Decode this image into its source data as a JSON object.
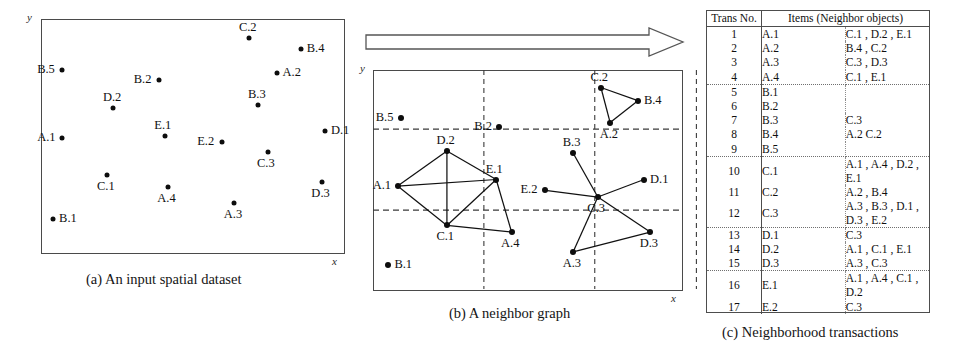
{
  "figure": {
    "panels": [
      {
        "id": "a",
        "caption": "(a) An input spatial dataset",
        "y_axis_label": "y",
        "x_axis_label": "x"
      },
      {
        "id": "b",
        "caption": "(b) A neighbor graph",
        "y_axis_label": "y",
        "x_axis_label": "x"
      },
      {
        "id": "c",
        "caption": "(c) Neighborhood transactions"
      }
    ],
    "arrow": "right-block-arrow"
  },
  "chart_data": {
    "type": "scatter",
    "xlabel": "x",
    "ylabel": "y",
    "xlim": [
      0,
      100
    ],
    "ylim": [
      0,
      100
    ],
    "grid": false,
    "panel_a": {
      "type": "scatter",
      "title": "(a) An input spatial dataset",
      "xlabel": "x",
      "ylabel": "y",
      "points": [
        {
          "name": "B.5",
          "x": 7,
          "y": 78,
          "label_pos": "left"
        },
        {
          "name": "C.2",
          "x": 69,
          "y": 92,
          "label_pos": "above"
        },
        {
          "name": "B.4",
          "x": 86,
          "y": 87,
          "label_pos": "right"
        },
        {
          "name": "A.2",
          "x": 78,
          "y": 77,
          "label_pos": "right"
        },
        {
          "name": "B.2",
          "x": 39,
          "y": 74,
          "label_pos": "left"
        },
        {
          "name": "B.3",
          "x": 72,
          "y": 63,
          "label_pos": "above"
        },
        {
          "name": "D.2",
          "x": 24,
          "y": 62,
          "label_pos": "above"
        },
        {
          "name": "D.1",
          "x": 94,
          "y": 52,
          "label_pos": "right"
        },
        {
          "name": "E.1",
          "x": 41,
          "y": 50,
          "label_pos": "above"
        },
        {
          "name": "A.1",
          "x": 7,
          "y": 49,
          "label_pos": "left"
        },
        {
          "name": "E.2",
          "x": 60,
          "y": 47,
          "label_pos": "left"
        },
        {
          "name": "C.3",
          "x": 75,
          "y": 43,
          "label_pos": "below"
        },
        {
          "name": "C.1",
          "x": 22,
          "y": 33,
          "label_pos": "below"
        },
        {
          "name": "D.3",
          "x": 93,
          "y": 30,
          "label_pos": "below"
        },
        {
          "name": "A.4",
          "x": 42,
          "y": 28,
          "label_pos": "below"
        },
        {
          "name": "A.3",
          "x": 64,
          "y": 21,
          "label_pos": "below"
        },
        {
          "name": "B.1",
          "x": 4,
          "y": 14,
          "label_pos": "right"
        }
      ]
    },
    "panel_b": {
      "type": "scatter",
      "title": "(b) A neighbor graph",
      "xlabel": "x",
      "ylabel": "y",
      "grid": true,
      "gridlines": {
        "vertical": [
          36,
          72,
          105
        ],
        "horizontal": [
          36,
          73
        ]
      },
      "points": [
        {
          "name": "B.5",
          "x": 9,
          "y": 78,
          "label_pos": "left"
        },
        {
          "name": "C.2",
          "x": 74,
          "y": 92,
          "label_pos": "above"
        },
        {
          "name": "B.4",
          "x": 86,
          "y": 86,
          "label_pos": "right"
        },
        {
          "name": "A.2",
          "x": 77,
          "y": 76,
          "label_pos": "below"
        },
        {
          "name": "B.2",
          "x": 41,
          "y": 74,
          "label_pos": "left"
        },
        {
          "name": "B.3",
          "x": 65,
          "y": 62,
          "label_pos": "above"
        },
        {
          "name": "D.2",
          "x": 24,
          "y": 63,
          "label_pos": "above"
        },
        {
          "name": "D.1",
          "x": 88,
          "y": 50,
          "label_pos": "right"
        },
        {
          "name": "E.1",
          "x": 40,
          "y": 50,
          "label_pos": "above"
        },
        {
          "name": "A.1",
          "x": 8,
          "y": 47,
          "label_pos": "left"
        },
        {
          "name": "E.2",
          "x": 56,
          "y": 45,
          "label_pos": "left"
        },
        {
          "name": "C.3",
          "x": 73,
          "y": 42,
          "label_pos": "below"
        },
        {
          "name": "C.1",
          "x": 24,
          "y": 29,
          "label_pos": "below"
        },
        {
          "name": "D.3",
          "x": 90,
          "y": 26,
          "label_pos": "below"
        },
        {
          "name": "A.4",
          "x": 45,
          "y": 26,
          "label_pos": "below"
        },
        {
          "name": "A.3",
          "x": 65,
          "y": 17,
          "label_pos": "below"
        },
        {
          "name": "B.1",
          "x": 5,
          "y": 11,
          "label_pos": "right"
        }
      ],
      "edges": [
        [
          "A.1",
          "D.2"
        ],
        [
          "A.1",
          "E.1"
        ],
        [
          "A.1",
          "C.1"
        ],
        [
          "D.2",
          "E.1"
        ],
        [
          "D.2",
          "C.1"
        ],
        [
          "E.1",
          "C.1"
        ],
        [
          "C.1",
          "A.4"
        ],
        [
          "E.1",
          "A.4"
        ],
        [
          "C.2",
          "B.4"
        ],
        [
          "C.2",
          "A.2"
        ],
        [
          "B.4",
          "A.2"
        ],
        [
          "C.3",
          "B.3"
        ],
        [
          "C.3",
          "E.2"
        ],
        [
          "C.3",
          "D.1"
        ],
        [
          "C.3",
          "D.3"
        ],
        [
          "C.3",
          "A.3"
        ],
        [
          "A.3",
          "D.3"
        ]
      ]
    },
    "panel_c": {
      "type": "table",
      "title": "(c) Neighborhood transactions",
      "columns": [
        "Trans No.",
        "Items (Neighbor objects)"
      ],
      "rows": [
        {
          "no": "1",
          "obj": "A.1",
          "items": "C.1 , D.2 , E.1",
          "group_end": false
        },
        {
          "no": "2",
          "obj": "A.2",
          "items": "B.4 , C.2",
          "group_end": false
        },
        {
          "no": "3",
          "obj": "A.3",
          "items": "C.3 , D.3",
          "group_end": false
        },
        {
          "no": "4",
          "obj": "A.4",
          "items": "C.1 , E.1",
          "group_end": true
        },
        {
          "no": "5",
          "obj": "B.1",
          "items": "",
          "group_end": false
        },
        {
          "no": "6",
          "obj": "B.2",
          "items": "",
          "group_end": false
        },
        {
          "no": "7",
          "obj": "B.3",
          "items": "C.3",
          "group_end": false
        },
        {
          "no": "8",
          "obj": "B.4",
          "items": "A.2  C.2",
          "group_end": false
        },
        {
          "no": "9",
          "obj": "B.5",
          "items": "",
          "group_end": true
        },
        {
          "no": "10",
          "obj": "C.1",
          "items": "A.1 , A.4 , D.2 , E.1",
          "group_end": false
        },
        {
          "no": "11",
          "obj": "C.2",
          "items": "A.2 , B.4",
          "group_end": false
        },
        {
          "no": "12",
          "obj": "C.3",
          "items": "A.3 , B.3 , D.1 , D.3 , E.2",
          "group_end": true
        },
        {
          "no": "13",
          "obj": "D.1",
          "items": "C.3",
          "group_end": false
        },
        {
          "no": "14",
          "obj": "D.2",
          "items": "A.1 , C.1 , E.1",
          "group_end": false
        },
        {
          "no": "15",
          "obj": "D.3",
          "items": "A.3 , C.3",
          "group_end": true
        },
        {
          "no": "16",
          "obj": "E.1",
          "items": "A.1 , A.4 , C.1 , D.2",
          "group_end": false
        },
        {
          "no": "17",
          "obj": "E.2",
          "items": "C.3",
          "group_end": false
        }
      ]
    }
  }
}
